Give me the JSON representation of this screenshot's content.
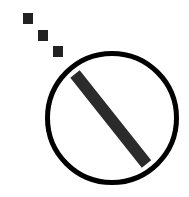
{
  "icon": {
    "name": "disabled-dots-icon",
    "description": "Prohibition circle with diagonal slash and three trailing dots",
    "colors": {
      "background": "#ffffff",
      "ring": "#000000",
      "slash": "#2b2b2b",
      "dots": "#222222"
    }
  }
}
